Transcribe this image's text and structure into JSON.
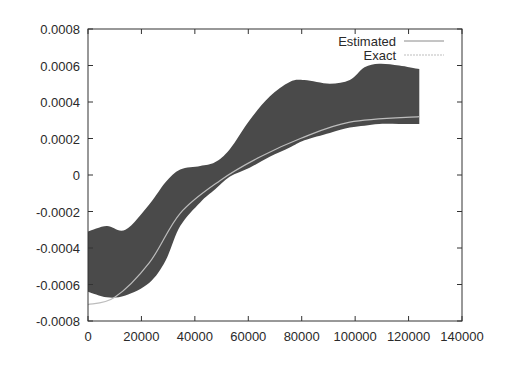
{
  "chart_data": {
    "type": "area",
    "title": "",
    "xlabel": "",
    "ylabel": "",
    "xlim": [
      0,
      140000
    ],
    "ylim": [
      -0.0008,
      0.0008
    ],
    "grid": false,
    "legend_position": "top-right",
    "x_ticks": [
      "0",
      "20000",
      "40000",
      "60000",
      "80000",
      "100000",
      "120000",
      "140000"
    ],
    "y_ticks": [
      "0.0008",
      "0.0006",
      "0.0004",
      "0.0002",
      "0",
      "-0.0002",
      "-0.0004",
      "-0.0006",
      "-0.0008"
    ],
    "series": [
      {
        "name": "Estimated",
        "style": "filled band (dense dark gray)",
        "x": [
          0,
          7000,
          14000,
          23000,
          29000,
          34500,
          42000,
          47500,
          53000,
          60500,
          68000,
          75500,
          81000,
          90500,
          98000,
          103500,
          109000,
          116500,
          124000
        ],
        "upper": [
          -0.00031,
          -0.00028,
          -0.0003,
          -0.00016,
          -4e-05,
          3e-05,
          5e-05,
          7e-05,
          0.00014,
          0.0003,
          0.00043,
          0.00051,
          0.00052,
          0.0005,
          0.00052,
          0.00059,
          0.00061,
          0.0006,
          0.00058
        ],
        "lower": [
          -0.00064,
          -0.00067,
          -0.00066,
          -0.00059,
          -0.00047,
          -0.00028,
          -0.00015,
          -8e-05,
          -1e-05,
          4e-05,
          0.0001,
          0.00015,
          0.00019,
          0.00023,
          0.00026,
          0.00027,
          0.00028,
          0.00028,
          0.00028
        ]
      },
      {
        "name": "Exact",
        "style": "thin light gray line",
        "x": [
          0,
          10000,
          23000,
          34500,
          49500,
          64500,
          79500,
          98000,
          124000
        ],
        "values": [
          -0.00071,
          -0.00067,
          -0.00048,
          -0.00021,
          -3e-05,
          0.0001,
          0.0002,
          0.00029,
          0.00032
        ]
      }
    ]
  },
  "legend": {
    "items": [
      {
        "label": "Estimated"
      },
      {
        "label": "Exact"
      }
    ]
  },
  "colors": {
    "band": "#4a4a4a",
    "exact_line": "#bdbdbd",
    "estimated_line": "#8a8a8a",
    "axis": "#333333"
  }
}
